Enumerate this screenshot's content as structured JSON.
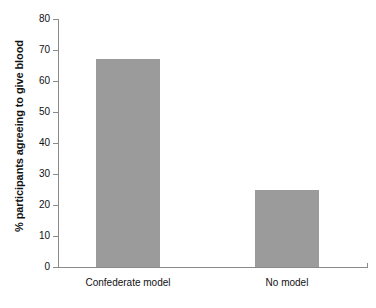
{
  "chart_data": {
    "type": "bar",
    "title": "",
    "subtitle": "",
    "xlabel": "",
    "ylabel": "% participants agreeing to give blood",
    "categories": [
      "Confederate model",
      "No model"
    ],
    "values": [
      67,
      25
    ],
    "ylim": [
      0,
      80
    ],
    "yticks": [
      0,
      10,
      20,
      30,
      40,
      50,
      60,
      70,
      80
    ],
    "ytick_labels": [
      "0",
      "10",
      "20",
      "30",
      "40",
      "50",
      "60",
      "70",
      "80"
    ],
    "grid": false,
    "legend": false,
    "legend_position": "none",
    "bar_color": "#9b9b9b",
    "axis_color": "#8a8a8a",
    "background_color": "#ffffff",
    "annotations": []
  }
}
